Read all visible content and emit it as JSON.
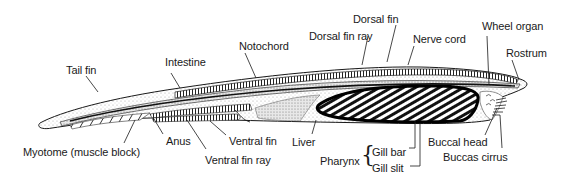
{
  "diagram": {
    "colors": {
      "ink": "#1a1a1a",
      "stipple": "#b8b8b8",
      "background": "#ffffff"
    },
    "labels": {
      "tail_fin": "Tail fin",
      "intestine": "Intestine",
      "notochord": "Notochord",
      "dorsal_fin": "Dorsal fin",
      "dorsal_fin_ray": "Dorsal fin ray",
      "nerve_cord": "Nerve cord",
      "wheel_organ": "Wheel organ",
      "rostrum": "Rostrum",
      "myotome": "Myotome (muscle block)",
      "anus": "Anus",
      "ventral_fin": "Ventral fin",
      "ventral_fin_ray": "Ventral fin ray",
      "liver": "Liver",
      "pharynx": "Pharynx",
      "gill_bar": "Gill bar",
      "gill_slit": "Gill slit",
      "buccal_head": "Buccal head",
      "buccas_cirrus": "Buccas cirrus"
    }
  }
}
